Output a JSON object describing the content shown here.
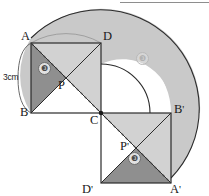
{
  "figure": {
    "dimension_label": "3cm",
    "points": {
      "A": "A",
      "B": "B",
      "C": "C",
      "D": "D",
      "P": "P",
      "A_prime_base": "A",
      "A_prime_mark": "'",
      "B_prime_base": "B",
      "B_prime_mark": "'",
      "D_prime_base": "D",
      "D_prime_mark": "'",
      "P_prime_base": "P",
      "P_prime_mark": "'"
    },
    "region_marks": {
      "upper_triangle": "❸",
      "sector": "❸",
      "lower_triangle": "❸"
    },
    "colors": {
      "stroke": "#2b2b2b",
      "sector_fill": "#c9c9c9",
      "dark_triangle_fill": "#8f8f8f",
      "light_triangle_fill": "#d2d2d2",
      "white_fill": "#ffffff",
      "dashed_stroke": "#3a3a3a"
    },
    "geometry": {
      "centre": [
        101,
        113
      ],
      "square_side_px": 70,
      "outer_radius_px": 99,
      "inner_radius_px": 49,
      "sector_start_deg": 180,
      "sector_sweep_deg": 270
    }
  }
}
